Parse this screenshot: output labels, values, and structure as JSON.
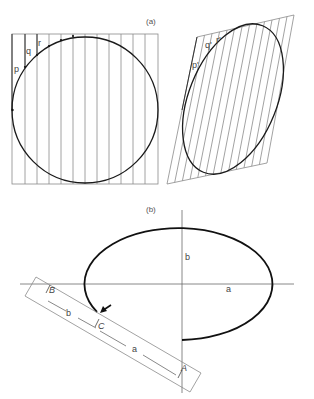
{
  "panel_a": {
    "caption": "(a)",
    "left_labels": {
      "p": "p",
      "q": "q",
      "r": "r"
    },
    "right_labels": {
      "p": "p'",
      "q": "q'",
      "r": "r'"
    }
  },
  "panel_b": {
    "caption": "(b)",
    "axis_labels": {
      "b": "b",
      "a": "a"
    },
    "strip_labels": {
      "B": "B",
      "C": "C",
      "A": "A",
      "b": "b",
      "a": "a"
    }
  }
}
